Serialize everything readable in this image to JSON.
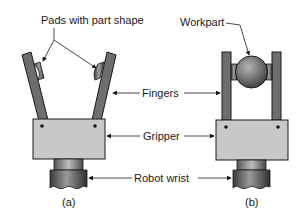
{
  "diagram": {
    "labels": {
      "pads": "Pads with part shape",
      "workpart": "Workpart",
      "fingers": "Fingers",
      "gripper": "Gripper",
      "robot_wrist": "Robot wrist"
    },
    "captions": {
      "a": "(a)",
      "b": "(b)"
    },
    "colors": {
      "finger": "#6e6e6e",
      "gripper_body": "#c8c8c8",
      "outline": "#1a1a1a",
      "wrist": "#5a5a5a",
      "workpart": "#7a7a7a"
    }
  }
}
